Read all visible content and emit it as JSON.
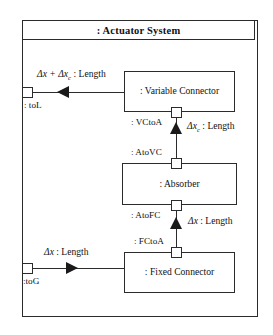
{
  "diagram": {
    "title": ": Actuator System",
    "parts": [
      {
        "id": "variable-connector",
        "label": ": Variable Connector"
      },
      {
        "id": "absorber",
        "label": ": Absorber"
      },
      {
        "id": "fixed-connector",
        "label": ": Fixed Connector"
      }
    ],
    "ports": [
      {
        "id": "toL",
        "label": ": toL"
      },
      {
        "id": "toG",
        "label": ":toG"
      },
      {
        "id": "VCtoA",
        "label": ": VCtoA"
      },
      {
        "id": "AtoVC",
        "label": ": AtoVC"
      },
      {
        "id": "AtoFC",
        "label": ": AtoFC"
      },
      {
        "id": "FCtoA",
        "label": ": FCtoA"
      }
    ],
    "flows": [
      {
        "id": "flow-top",
        "expression": "Δx + Δx",
        "subscript": "c",
        "type": ": Length",
        "direction": "left"
      },
      {
        "id": "flow-mid",
        "expression": "Δx",
        "subscript": "c",
        "type": ": Length",
        "direction": "up"
      },
      {
        "id": "flow-lower",
        "expression": "Δx",
        "subscript": "",
        "type": ": Length",
        "direction": "up"
      },
      {
        "id": "flow-bottom",
        "expression": "Δx",
        "subscript": "",
        "type": ": Length",
        "direction": "right"
      }
    ]
  },
  "colors": {
    "stroke": "#2b2b2b",
    "arrow": "#1a1a1a",
    "background": "#ffffff",
    "text": "#111111"
  }
}
